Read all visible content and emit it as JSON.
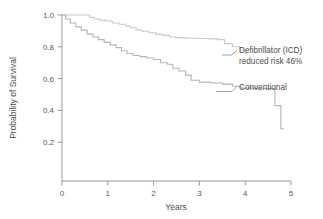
{
  "chart_data": {
    "type": "line",
    "title": "",
    "subtitle": "",
    "xlabel": "Years",
    "ylabel": "Probability of Survival",
    "xlim": [
      0,
      5
    ],
    "ylim": [
      0,
      1.0
    ],
    "grid": false,
    "legend_position": "inline-annotation",
    "x_ticks": [
      "0",
      "1",
      "2",
      "3",
      "4",
      "5"
    ],
    "x_tick_values": [
      0,
      1,
      2,
      3,
      4,
      5
    ],
    "y_ticks": [
      "0.2",
      "0.4",
      "0.6",
      "0.8",
      "1.0"
    ],
    "y_tick_values": [
      0.2,
      0.4,
      0.6,
      0.8,
      1.0
    ],
    "curve_style": "kaplan-meier-step",
    "series": [
      {
        "name": "Defibrillator (ICD)",
        "color": "#c9c9c9",
        "annotation": "Defibrillator (ICD)",
        "annotation_line2": "reduced risk 46%",
        "x": [
          0.0,
          0.52,
          0.6,
          0.7,
          0.82,
          0.95,
          1.1,
          1.25,
          1.4,
          1.5,
          1.62,
          1.75,
          1.9,
          2.05,
          2.2,
          2.35,
          2.48,
          2.6,
          2.75,
          2.95,
          3.2,
          3.42,
          3.55,
          3.72,
          3.88,
          4.0
        ],
        "y": [
          1.0,
          1.0,
          0.985,
          0.975,
          0.968,
          0.962,
          0.95,
          0.942,
          0.93,
          0.92,
          0.905,
          0.898,
          0.888,
          0.878,
          0.872,
          0.862,
          0.858,
          0.856,
          0.854,
          0.852,
          0.85,
          0.845,
          0.82,
          0.8,
          0.78,
          0.755
        ]
      },
      {
        "name": "Conventional",
        "color": "#b5b5b5",
        "annotation": "Conventional",
        "x": [
          0.0,
          0.08,
          0.18,
          0.3,
          0.42,
          0.55,
          0.68,
          0.8,
          0.92,
          1.05,
          1.18,
          1.3,
          1.42,
          1.55,
          1.7,
          1.85,
          2.0,
          2.15,
          2.3,
          2.42,
          2.55,
          2.7,
          2.82,
          3.0,
          3.25,
          3.5,
          3.72,
          3.9,
          4.2,
          4.6,
          4.65,
          4.78,
          4.85
        ],
        "y": [
          1.0,
          0.975,
          0.95,
          0.925,
          0.905,
          0.88,
          0.862,
          0.845,
          0.828,
          0.812,
          0.795,
          0.775,
          0.758,
          0.745,
          0.738,
          0.73,
          0.72,
          0.7,
          0.69,
          0.665,
          0.648,
          0.622,
          0.59,
          0.578,
          0.572,
          0.565,
          0.552,
          0.54,
          0.538,
          0.538,
          0.43,
          0.285,
          0.285
        ]
      }
    ]
  },
  "axes": {
    "x_title": "Years",
    "y_title": "Probability of Survival",
    "x_tick_labels": [
      "0",
      "1",
      "2",
      "3",
      "4",
      "5"
    ],
    "y_tick_labels": [
      "1.0",
      "0.8",
      "0.6",
      "0.4",
      "0.2"
    ]
  },
  "annotations": {
    "icd_line1": "Defibrillator (ICD)",
    "icd_line2": "reduced risk 46%",
    "conventional": "Conventional"
  },
  "colors": {
    "axis": "#8c8c8c",
    "icd_curve": "#c9c9c9",
    "conventional_curve": "#b5b5b5",
    "text": "#4d4d4d",
    "background": "#ffffff"
  }
}
